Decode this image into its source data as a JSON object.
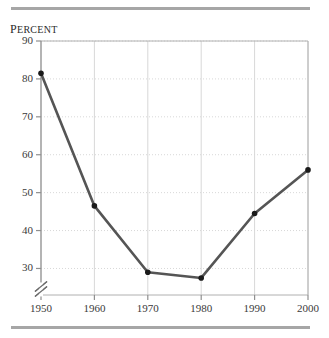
{
  "figure": {
    "axis_label": "Percent",
    "axis_label_lead": "P",
    "axis_label_rest": "ERCENT"
  },
  "colors": {
    "rule": "#a6a6a6",
    "plot_border": "#b0b0b0",
    "gridline": "#d8d8d8",
    "data_line": "#555555",
    "marker": "#1a1a1a",
    "text": "#3a3a3a",
    "background": "#ffffff"
  },
  "chart_data": {
    "type": "line",
    "title": "",
    "subtitle": "",
    "xlabel": "",
    "ylabel": "Percent",
    "categories": [
      "1950",
      "1960",
      "1970",
      "1980",
      "1990",
      "2000"
    ],
    "x": [
      1950,
      1960,
      1970,
      1980,
      1990,
      2000
    ],
    "values": [
      81.5,
      46.5,
      29.0,
      27.5,
      44.5,
      56.0
    ],
    "series": [
      {
        "name": "Percent",
        "values": [
          81.5,
          46.5,
          29.0,
          27.5,
          44.5,
          56.0
        ]
      }
    ],
    "xlim": [
      1950,
      2000
    ],
    "ylim": [
      23,
      90
    ],
    "xticks": [
      1950,
      1960,
      1970,
      1980,
      1990,
      2000
    ],
    "xtick_labels": [
      "1950",
      "1960",
      "1970",
      "1980",
      "1990",
      "2000"
    ],
    "yticks": [
      30,
      40,
      50,
      60,
      70,
      80,
      90
    ],
    "ytick_labels": [
      "30",
      "40",
      "50",
      "60",
      "70",
      "80",
      "90"
    ],
    "grid": true,
    "grid_style": "dotted",
    "legend": false,
    "legend_position": "none",
    "axis_break": {
      "axis": "y",
      "symbol": "double-slash",
      "below_value": 30
    },
    "markers": true,
    "annotations": []
  }
}
